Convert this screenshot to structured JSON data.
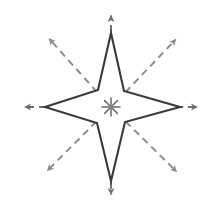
{
  "figure": {
    "title": "Four-pointed compass star with eight directional arrows",
    "width": 214,
    "height": 208,
    "background_color": "#ffffff",
    "center": {
      "x": 111,
      "y": 107
    }
  },
  "chart_data": {
    "type": "diagram",
    "title": "Four-pointed compass star with eight directional arrows",
    "xlabel": "",
    "ylabel": "",
    "grid": false,
    "legend": null,
    "center_marker": {
      "name": "asterisk-starburst",
      "x": 111,
      "y": 107,
      "radius": 9,
      "ray_count": 8,
      "color": "#6e6e6e"
    },
    "star": {
      "points": 4,
      "outline_color": "#3a3a3a",
      "fill_color": "#ffffff",
      "stroke_width": 2.1,
      "outer_tips": [
        {
          "direction": "north",
          "x": 111,
          "y": 33
        },
        {
          "direction": "east",
          "x": 180,
          "y": 107
        },
        {
          "direction": "south",
          "x": 111,
          "y": 181
        },
        {
          "direction": "west",
          "x": 45,
          "y": 107
        }
      ],
      "inner_vertices": [
        {
          "direction": "northeast",
          "x": 124,
          "y": 91
        },
        {
          "direction": "southeast",
          "x": 125,
          "y": 122
        },
        {
          "direction": "southwest",
          "x": 97,
          "y": 123
        },
        {
          "direction": "northwest",
          "x": 98,
          "y": 90
        }
      ]
    },
    "arrows": [
      {
        "name": "arrow-north",
        "direction": "north",
        "angle_deg": 90,
        "tip_x": 111,
        "tip_y": 8,
        "tail_x": 111,
        "tail_y": 104,
        "style": "dashed",
        "color": "#6e6e6e"
      },
      {
        "name": "arrow-northeast",
        "direction": "northeast",
        "angle_deg": 45,
        "tip_x": 181,
        "tip_y": 34,
        "tail_x": 117,
        "tail_y": 101,
        "style": "dashed",
        "color": "#8a8a8a"
      },
      {
        "name": "arrow-east",
        "direction": "east",
        "angle_deg": 0,
        "tip_x": 205,
        "tip_y": 107,
        "tail_x": 116,
        "tail_y": 107,
        "style": "dashed",
        "color": "#6e6e6e"
      },
      {
        "name": "arrow-southeast",
        "direction": "southeast",
        "angle_deg": -45,
        "tip_x": 182,
        "tip_y": 177,
        "tail_x": 117,
        "tail_y": 113,
        "style": "dashed",
        "color": "#8a8a8a"
      },
      {
        "name": "arrow-south",
        "direction": "south",
        "angle_deg": -90,
        "tip_x": 111,
        "tip_y": 202,
        "tail_x": 111,
        "tail_y": 110,
        "style": "dashed",
        "color": "#6e6e6e"
      },
      {
        "name": "arrow-southwest",
        "direction": "southwest",
        "angle_deg": -135,
        "tip_x": 42,
        "tip_y": 176,
        "tail_x": 105,
        "tail_y": 113,
        "style": "dashed",
        "color": "#8a8a8a"
      },
      {
        "name": "arrow-west",
        "direction": "west",
        "angle_deg": 180,
        "tip_x": 17,
        "tip_y": 107,
        "tail_x": 106,
        "tail_y": 107,
        "style": "dashed",
        "color": "#6e6e6e"
      },
      {
        "name": "arrow-northwest",
        "direction": "northwest",
        "angle_deg": 135,
        "tip_x": 44,
        "tip_y": 33,
        "tail_x": 105,
        "tail_y": 101,
        "style": "dashed",
        "color": "#8a8a8a"
      }
    ],
    "dash_pattern": "7 5",
    "dash_width": 1.9
  }
}
